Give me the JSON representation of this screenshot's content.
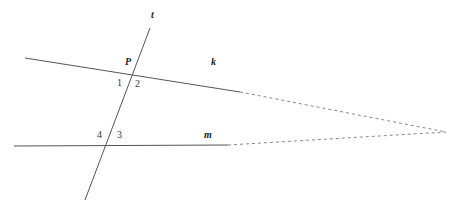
{
  "diagram": {
    "type": "parallel-lines-transversal",
    "colors": {
      "line": "#555555",
      "dashed": "#888888",
      "text": "#222222"
    },
    "lines": {
      "k": {
        "label": "k",
        "solid": [
          [
            25,
            58
          ],
          [
            240,
            92
          ]
        ],
        "dashed": [
          [
            240,
            92
          ],
          [
            446,
            132
          ]
        ]
      },
      "m": {
        "label": "m",
        "solid": [
          [
            14,
            146
          ],
          [
            228,
            145
          ]
        ],
        "dashed": [
          [
            228,
            145
          ],
          [
            446,
            132
          ]
        ]
      },
      "t": {
        "label": "t",
        "solid": [
          [
            150,
            28
          ],
          [
            85,
            200
          ]
        ]
      }
    },
    "points": {
      "P": {
        "label": "P"
      }
    },
    "angles": [
      {
        "label": "1"
      },
      {
        "label": "2"
      },
      {
        "label": "3"
      },
      {
        "label": "4"
      }
    ]
  }
}
